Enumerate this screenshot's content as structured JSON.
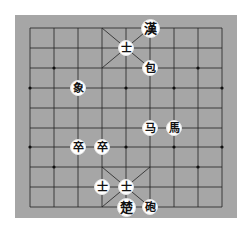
{
  "board": {
    "background": "#a6a6a6",
    "line_color": "#222222",
    "columns_x": [
      30,
      54,
      78,
      102,
      126,
      150,
      174,
      198,
      222
    ],
    "rows_y": [
      28,
      48,
      68,
      88,
      108,
      128,
      147,
      167,
      187,
      207
    ]
  },
  "pieces": [
    {
      "char": "漢",
      "col": 5,
      "row": 0,
      "king": true
    },
    {
      "char": "士",
      "col": 4,
      "row": 1
    },
    {
      "char": "包",
      "col": 5,
      "row": 2
    },
    {
      "char": "象",
      "col": 2,
      "row": 3
    },
    {
      "char": "马",
      "col": 5,
      "row": 5
    },
    {
      "char": "馬",
      "col": 6,
      "row": 5
    },
    {
      "char": "卒",
      "col": 2,
      "row": 6
    },
    {
      "char": "卒",
      "col": 3,
      "row": 6
    },
    {
      "char": "士",
      "col": 3,
      "row": 8
    },
    {
      "char": "士",
      "col": 4,
      "row": 8
    },
    {
      "char": "楚",
      "col": 4,
      "row": 9,
      "king": true
    },
    {
      "char": "砲",
      "col": 5,
      "row": 9
    }
  ],
  "markers": [
    {
      "col": 1,
      "row": 2
    },
    {
      "col": 7,
      "row": 2
    },
    {
      "col": 0,
      "row": 3
    },
    {
      "col": 4,
      "row": 3
    },
    {
      "col": 6,
      "row": 3
    },
    {
      "col": 8,
      "row": 3
    },
    {
      "col": 0,
      "row": 6
    },
    {
      "col": 4,
      "row": 6
    },
    {
      "col": 6,
      "row": 6
    },
    {
      "col": 8,
      "row": 6
    },
    {
      "col": 1,
      "row": 7
    },
    {
      "col": 7,
      "row": 7
    }
  ]
}
